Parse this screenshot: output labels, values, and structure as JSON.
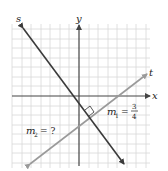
{
  "diagram": {
    "type": "coordinate-plane",
    "grid": {
      "visible": true,
      "color": "#d8d8d8"
    },
    "axes": {
      "x_label": "x",
      "y_label": "y",
      "color": "#444444"
    },
    "lines": [
      {
        "name": "s",
        "label": "s",
        "color": "#3a3a3a",
        "direction": "decreasing"
      },
      {
        "name": "t",
        "label": "t",
        "color": "#9a9a9a",
        "direction": "increasing"
      }
    ],
    "annotations": {
      "m1_var": "m",
      "m1_sub": "1",
      "m1_eq": "=",
      "m1_num": "3",
      "m1_den": "4",
      "m2_var": "m",
      "m2_sub": "2",
      "m2_eq": "= ?",
      "right_angle_marker": true
    }
  }
}
